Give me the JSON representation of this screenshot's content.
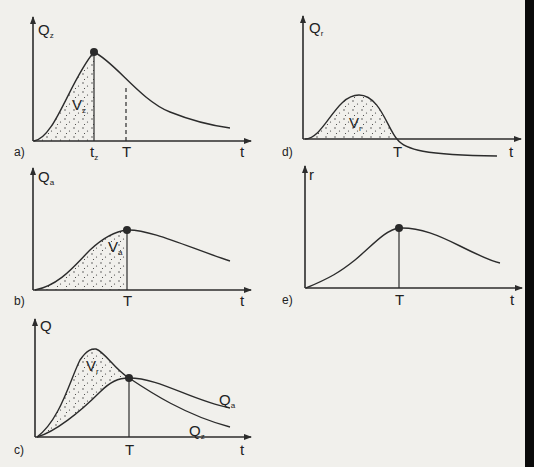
{
  "figure": {
    "panels": [
      {
        "id": "a",
        "panel_label": "a)",
        "y_label": "Q",
        "y_sub": "z",
        "x_label": "t",
        "ticks": [
          {
            "text": "t",
            "sub": "z"
          },
          {
            "text": "T"
          }
        ],
        "area_label": "V",
        "area_sub": "z"
      },
      {
        "id": "b",
        "panel_label": "b)",
        "y_label": "Q",
        "y_sub": "a",
        "x_label": "t",
        "ticks": [
          {
            "text": "T"
          }
        ],
        "area_label": "V",
        "area_sub": "a"
      },
      {
        "id": "c",
        "panel_label": "c)",
        "y_label": "Q",
        "x_label": "t",
        "ticks": [
          {
            "text": "T"
          }
        ],
        "area_label": "V",
        "area_sub": "r",
        "curve_labels": [
          {
            "text": "Q",
            "sub": "a"
          },
          {
            "text": "Q",
            "sub": "z"
          }
        ]
      },
      {
        "id": "d",
        "panel_label": "d)",
        "y_label": "Q",
        "y_sub": "r",
        "x_label": "t",
        "ticks": [
          {
            "text": "T"
          }
        ],
        "area_label": "V",
        "area_sub": "r"
      },
      {
        "id": "e",
        "panel_label": "e)",
        "y_label": "r",
        "x_label": "t",
        "ticks": [
          {
            "text": "T"
          }
        ]
      }
    ],
    "colors": {
      "ink": "#2c2c2c",
      "paper": "#f1f0ec"
    }
  }
}
